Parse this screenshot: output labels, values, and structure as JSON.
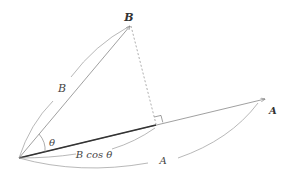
{
  "diagram": {
    "labels": {
      "vector_b_tip": "B",
      "vector_a_tip": "A",
      "b_magnitude": "B",
      "a_magnitude": "A",
      "angle": "θ",
      "projection": "B cos θ"
    },
    "points": {
      "origin": [
        19,
        158
      ],
      "b_tip": [
        131,
        25
      ],
      "a_tip": [
        266,
        99
      ],
      "foot": [
        156,
        124
      ]
    },
    "colors": {
      "thin_line": "#888888",
      "projection_line": "#333333",
      "dashed_line": "#999999",
      "text": "#444444"
    }
  }
}
